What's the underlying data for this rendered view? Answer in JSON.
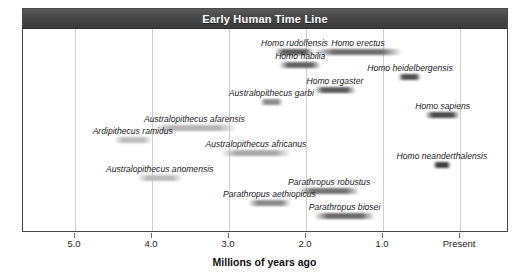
{
  "chart_data": {
    "type": "bar",
    "title": "Early Human Time Line",
    "xlabel": "Millions of years ago",
    "ylabel": "",
    "xlim": [
      5.45,
      -0.3
    ],
    "axis_direction": "reversed",
    "grid": true,
    "legend": "none",
    "x_ticks": [
      {
        "label": "5.0",
        "value": 5.0
      },
      {
        "label": "4.0",
        "value": 4.0
      },
      {
        "label": "3.0",
        "value": 3.0
      },
      {
        "label": "2.0",
        "value": 2.0
      },
      {
        "label": "1.0",
        "value": 1.0
      },
      {
        "label": "Present",
        "value": 0.0
      }
    ],
    "units": "millions of years ago",
    "series": [
      {
        "name": "Homo rudolfensis",
        "start_mya": 2.4,
        "end_mya": 1.9,
        "row": 0,
        "label_align": "center",
        "color": "#5b5b5b"
      },
      {
        "name": "Homo erectus",
        "start_mya": 1.9,
        "end_mya": 0.75,
        "row": 0,
        "label_align": "center",
        "color": "#6e6e6e"
      },
      {
        "name": "Homo habilia",
        "start_mya": 2.35,
        "end_mya": 1.8,
        "row": 1,
        "label_align": "center",
        "color": "#636363"
      },
      {
        "name": "Homo heidelbergensis",
        "start_mya": 0.8,
        "end_mya": 0.5,
        "row": 2,
        "label_align": "center",
        "color": "#4f4f4f"
      },
      {
        "name": "Homo ergaster",
        "start_mya": 1.9,
        "end_mya": 1.35,
        "row": 3,
        "label_align": "center",
        "color": "#5a5a5a"
      },
      {
        "name": "Australopithecus garbi",
        "start_mya": 2.6,
        "end_mya": 2.3,
        "row": 4,
        "label_align": "center",
        "color": "#8d8d8d"
      },
      {
        "name": "Homo sapiens",
        "start_mya": 0.45,
        "end_mya": 0.0,
        "row": 5,
        "label_align": "center",
        "color": "#4a4a4a"
      },
      {
        "name": "Australopithecus afarensis",
        "start_mya": 4.0,
        "end_mya": 2.9,
        "row": 6,
        "label_align": "center",
        "color": "#b4b4b4"
      },
      {
        "name": "Ardipithecus ramidus",
        "start_mya": 4.5,
        "end_mya": 4.0,
        "row": 7,
        "label_align": "center",
        "color": "#bdbdbd"
      },
      {
        "name": "Australopithecus africanus",
        "start_mya": 3.1,
        "end_mya": 2.2,
        "row": 8,
        "label_align": "center",
        "color": "#a8a8a8"
      },
      {
        "name": "Homo neanderthalensis",
        "start_mya": 0.35,
        "end_mya": 0.12,
        "row": 9,
        "label_align": "center",
        "color": "#3f3f3f"
      },
      {
        "name": "Australopithecus anomensis",
        "start_mya": 4.2,
        "end_mya": 3.6,
        "row": 10,
        "label_align": "center",
        "color": "#bcbcbc"
      },
      {
        "name": "Parathropus robustus",
        "start_mya": 2.1,
        "end_mya": 1.3,
        "row": 11,
        "label_align": "center",
        "color": "#737373"
      },
      {
        "name": "Parathropus aethiopicus",
        "start_mya": 2.75,
        "end_mya": 2.2,
        "row": 12,
        "label_align": "center",
        "color": "#8a8a8a"
      },
      {
        "name": "Parathropus biosei",
        "start_mya": 1.9,
        "end_mya": 1.1,
        "row": 13,
        "label_align": "center",
        "color": "#6a6a6a"
      }
    ]
  }
}
